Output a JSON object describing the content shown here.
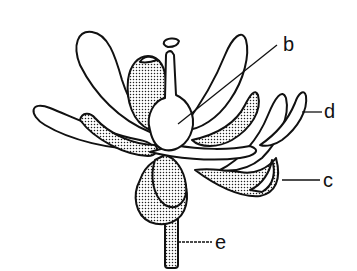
{
  "figure": {
    "labels": [
      {
        "id": "b",
        "text": "b",
        "points_to": "ovary"
      },
      {
        "id": "d",
        "text": "d",
        "points_to": "petal"
      },
      {
        "id": "c",
        "text": "c",
        "points_to": "sepal"
      },
      {
        "id": "e",
        "text": "e",
        "points_to": "pedicel"
      }
    ]
  },
  "colors": {
    "ink": "#111111",
    "background": "#ffffff"
  }
}
